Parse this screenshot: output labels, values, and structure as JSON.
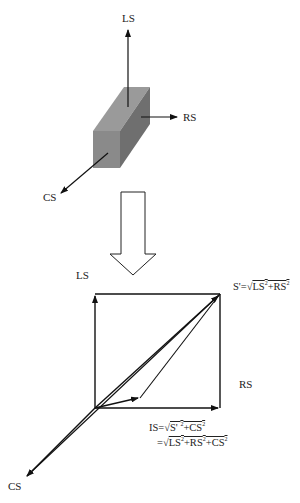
{
  "top_diagram": {
    "axis_labels": {
      "ls": "LS",
      "rs": "RS",
      "cs": "CS"
    },
    "box_colors": {
      "front": "#8a8a8a",
      "top": "#9a9a9a",
      "right": "#6f6f6f"
    }
  },
  "transition_arrow": {
    "icon": "hollow-down-arrow"
  },
  "bottom_diagram": {
    "axis_labels": {
      "ls": "LS",
      "rs": "RS",
      "cs": "CS"
    },
    "formula_s": {
      "lhs": "S'=√",
      "t1": "LS",
      "p1": "2",
      "plus1": "+RS",
      "p2": "2"
    },
    "formula_is_1": {
      "lhs": "IS=√",
      "t1": "S' ",
      "p1": "2",
      "plus1": "+CS",
      "p2": "2"
    },
    "formula_is_2": {
      "lhs": "=√",
      "t1": "LS",
      "p1": "2",
      "plus1": "+RS",
      "p2": "2",
      "plus2": "+CS",
      "p3": "2"
    }
  }
}
